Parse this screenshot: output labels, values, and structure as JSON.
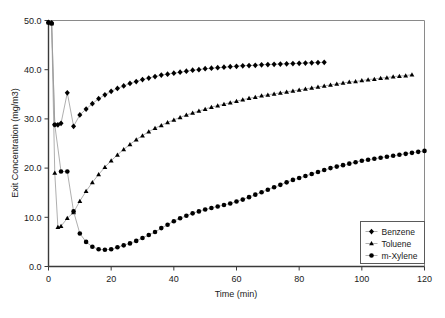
{
  "chart_data": {
    "type": "line",
    "title": "",
    "xlabel": "Time (min)",
    "ylabel": "Exit Concentration (mg/m3)",
    "xlim": [
      0,
      120
    ],
    "ylim": [
      0,
      50
    ],
    "xticks": [
      0,
      20,
      40,
      60,
      80,
      100,
      120
    ],
    "xtick_labels": [
      "0",
      "20",
      "40",
      "60",
      "80",
      "100",
      "120"
    ],
    "yticks": [
      0,
      10,
      20,
      30,
      40,
      50
    ],
    "ytick_labels": [
      "0.0",
      "10.0",
      "20.0",
      "30.0",
      "40.0",
      "50.0"
    ],
    "grid": false,
    "legend_position": "bottom-right",
    "marker_color": "#000000",
    "line_color": "#9a9a9a",
    "series": [
      {
        "name": "Benzene",
        "marker": "diamond",
        "x": [
          0,
          1,
          2,
          3,
          4,
          6,
          8,
          10,
          12,
          14,
          16,
          18,
          20,
          22,
          24,
          26,
          28,
          30,
          32,
          34,
          36,
          38,
          40,
          42,
          44,
          46,
          48,
          50,
          52,
          54,
          56,
          58,
          60,
          62,
          64,
          66,
          68,
          70,
          72,
          74,
          76,
          78,
          80,
          82,
          84,
          86,
          88
        ],
        "y": [
          49.6,
          49.5,
          28.8,
          28.8,
          29.1,
          35.3,
          28.5,
          30.8,
          32.0,
          33.1,
          34.1,
          34.9,
          35.6,
          36.2,
          36.7,
          37.2,
          37.6,
          38.0,
          38.3,
          38.6,
          38.9,
          39.1,
          39.3,
          39.5,
          39.7,
          39.9,
          40.0,
          40.2,
          40.3,
          40.4,
          40.5,
          40.6,
          40.7,
          40.8,
          40.85,
          40.9,
          41.0,
          41.05,
          41.1,
          41.15,
          41.2,
          41.25,
          41.3,
          41.35,
          41.4,
          41.45,
          41.5
        ]
      },
      {
        "name": "Toluene",
        "marker": "triangle",
        "x": [
          0,
          1,
          2,
          3,
          4,
          6,
          8,
          10,
          12,
          14,
          16,
          18,
          20,
          22,
          24,
          26,
          28,
          30,
          32,
          34,
          36,
          38,
          40,
          42,
          44,
          46,
          48,
          50,
          52,
          54,
          56,
          58,
          60,
          62,
          64,
          66,
          68,
          70,
          72,
          74,
          76,
          78,
          80,
          82,
          84,
          86,
          88,
          90,
          92,
          94,
          96,
          98,
          100,
          102,
          104,
          106,
          108,
          110,
          112,
          114,
          116
        ],
        "y": [
          49.6,
          49.4,
          19.0,
          8.0,
          8.2,
          9.8,
          11.0,
          13.3,
          15.3,
          17.1,
          18.7,
          20.2,
          21.5,
          22.7,
          23.8,
          24.8,
          25.8,
          26.6,
          27.4,
          28.1,
          28.7,
          29.3,
          29.8,
          30.3,
          30.8,
          31.2,
          31.6,
          32.0,
          32.4,
          32.7,
          33.0,
          33.3,
          33.6,
          33.9,
          34.2,
          34.4,
          34.7,
          34.9,
          35.1,
          35.3,
          35.5,
          35.7,
          35.9,
          36.1,
          36.3,
          36.5,
          36.7,
          36.9,
          37.1,
          37.3,
          37.5,
          37.6,
          37.8,
          38.0,
          38.1,
          38.3,
          38.4,
          38.6,
          38.7,
          38.8,
          39.0
        ]
      },
      {
        "name": "m-Xylene",
        "marker": "circle",
        "x": [
          0,
          1,
          2,
          4,
          6,
          8,
          10,
          12,
          14,
          16,
          18,
          20,
          22,
          24,
          26,
          28,
          30,
          32,
          34,
          36,
          38,
          40,
          42,
          44,
          46,
          48,
          50,
          52,
          54,
          56,
          58,
          60,
          62,
          64,
          66,
          68,
          70,
          72,
          74,
          76,
          78,
          80,
          82,
          84,
          86,
          88,
          90,
          92,
          94,
          96,
          98,
          100,
          102,
          104,
          106,
          108,
          110,
          112,
          114,
          116,
          118,
          120
        ],
        "y": [
          49.6,
          49.4,
          28.8,
          19.3,
          19.3,
          11.2,
          6.7,
          5.0,
          4.0,
          3.5,
          3.4,
          3.5,
          3.9,
          4.3,
          4.7,
          5.2,
          5.8,
          6.4,
          7.0,
          7.8,
          8.5,
          9.2,
          9.8,
          10.3,
          10.8,
          11.2,
          11.6,
          11.9,
          12.2,
          12.5,
          12.8,
          13.2,
          13.6,
          14.1,
          14.6,
          15.1,
          15.6,
          16.1,
          16.6,
          17.1,
          17.6,
          18.0,
          18.4,
          18.8,
          19.2,
          19.6,
          20.0,
          20.3,
          20.6,
          20.9,
          21.2,
          21.5,
          21.7,
          21.9,
          22.1,
          22.3,
          22.5,
          22.7,
          22.9,
          23.1,
          23.3,
          23.5
        ]
      }
    ]
  }
}
